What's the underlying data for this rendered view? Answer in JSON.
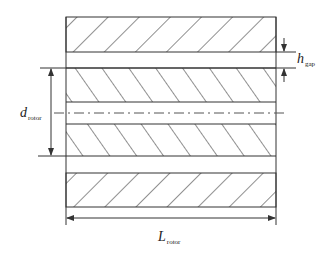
{
  "diagram": {
    "labels": {
      "h_gap": {
        "main": "h",
        "sub": "gap"
      },
      "d_rotor": {
        "main": "d",
        "sub": "rotor"
      },
      "L_rotor": {
        "main": "L",
        "sub": "rotor"
      }
    },
    "components": [
      "upper stator",
      "air gap",
      "rotor upper",
      "shaft centerline",
      "rotor lower",
      "air gap",
      "lower stator"
    ],
    "line_color": "#333333"
  }
}
